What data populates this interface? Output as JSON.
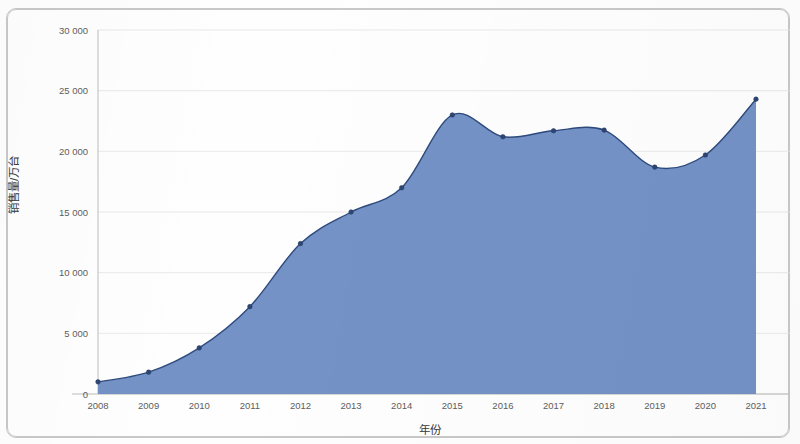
{
  "chart_data": {
    "type": "area",
    "title": "",
    "xlabel": "年份",
    "ylabel": "销售量/万台",
    "categories": [
      "2008",
      "2009",
      "2010",
      "2011",
      "2012",
      "2013",
      "2014",
      "2015",
      "2016",
      "2017",
      "2018",
      "2019",
      "2020",
      "2021"
    ],
    "values": [
      1000,
      1800,
      3800,
      7200,
      12400,
      15000,
      17000,
      23000,
      21200,
      21700,
      21750,
      18700,
      19700,
      24300
    ],
    "series": [
      {
        "name": "销售量",
        "values": [
          1000,
          1800,
          3800,
          7200,
          12400,
          15000,
          17000,
          23000,
          21200,
          21700,
          21750,
          18700,
          19700,
          24300
        ]
      }
    ],
    "x": [
      2008,
      2009,
      2010,
      2011,
      2012,
      2013,
      2014,
      2015,
      2016,
      2017,
      2018,
      2019,
      2020,
      2021
    ],
    "ylim": [
      0,
      30000
    ],
    "xlim": [
      2008,
      2021
    ],
    "yticks": [
      0,
      5000,
      10000,
      15000,
      20000,
      25000,
      30000
    ],
    "ytick_labels": [
      "0",
      "5 000",
      "10 000",
      "15 000",
      "20 000",
      "25 000",
      "30 000"
    ],
    "xticks": [
      2008,
      2009,
      2010,
      2011,
      2012,
      2013,
      2014,
      2015,
      2016,
      2017,
      2018,
      2019,
      2020,
      2021
    ],
    "xtick_labels": [
      "2008",
      "2009",
      "2010",
      "2011",
      "2012",
      "2013",
      "2014",
      "2015",
      "2016",
      "2017",
      "2018",
      "2019",
      "2020",
      "2021"
    ],
    "grid": true,
    "grid_axis": "y",
    "legend": false,
    "legend_position": "none",
    "markers": true,
    "colors": {
      "area_fill": "#6f8ec4",
      "line": "#2e4a7d",
      "marker": "#2d4674",
      "gridline": "#e3e3e3",
      "axis": "#b6b6b6",
      "tick_text": "#5d5d5d",
      "axis_title_text": "#3a3a3a",
      "background": "#ffffff",
      "frame_border": "#c8c8c8"
    }
  }
}
